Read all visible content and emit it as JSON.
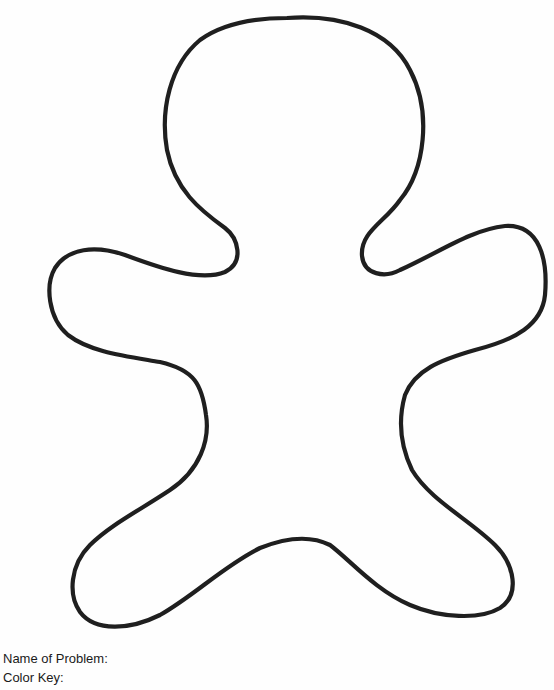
{
  "worksheet": {
    "figure": {
      "subject": "gingerbread-man-outline",
      "stroke_color": "#1f1f1f",
      "background_color": "#ffffff"
    },
    "labels": {
      "name_of_problem": "Name of Problem:",
      "color_key": "Color Key:"
    }
  }
}
